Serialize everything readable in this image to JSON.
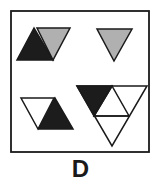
{
  "option_label": "D",
  "colors": {
    "dark": "#1c1c1c",
    "gray": "#b0b0b0",
    "white": "#ffffff",
    "stroke": "#1a1a1a"
  },
  "panels": [
    {
      "position": "top-left",
      "description": "parallelogram of two triangles",
      "fills": [
        "dark",
        "gray"
      ]
    },
    {
      "position": "top-right",
      "description": "single inverted triangle",
      "fills": [
        "gray"
      ]
    },
    {
      "position": "bottom-left",
      "description": "parallelogram of two triangles",
      "fills": [
        "white",
        "dark"
      ]
    },
    {
      "position": "bottom-right",
      "description": "inverted triangle split into four",
      "fills": [
        "dark",
        "white",
        "white",
        "white"
      ]
    }
  ]
}
